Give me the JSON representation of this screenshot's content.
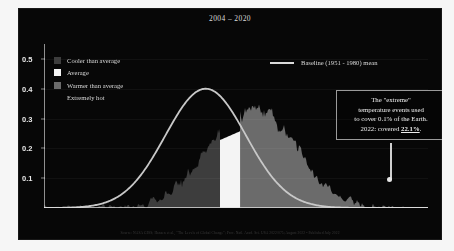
{
  "slide": {
    "title": "2004 – 2020",
    "background_color": "#070707",
    "text_color": "#dcdcdc"
  },
  "legend": {
    "items": [
      {
        "label": "Cooler than average",
        "swatch_color": "#3d3d3d",
        "name": "cooler-than-average"
      },
      {
        "label": "Average",
        "swatch_color": "#f4f4f4",
        "name": "average"
      },
      {
        "label": "Warmer than average",
        "swatch_color": "#6b6b6b",
        "name": "warmer-than-average"
      },
      {
        "label": "Extremely hot",
        "swatch_color": "transparent",
        "name": "extremely-hot"
      }
    ],
    "baseline": {
      "label": "Baseline (1951 - 1980) mean",
      "line_color": "#d9d9d9"
    }
  },
  "annotation": {
    "line1": "The \"extreme\"",
    "line2": "temperature events used",
    "line3": "to cover 0.1% of the Earth.",
    "line4_prefix": "2022: covered ",
    "line4_value": "22.1%",
    "line4_suffix": ".",
    "border_color": "#9a9a9a"
  },
  "axes": {
    "y_ticks": [
      "0.5",
      "0.4",
      "0.3",
      "0.2",
      "0.1"
    ],
    "y_values": [
      0.5,
      0.4,
      0.3,
      0.2,
      0.1
    ],
    "y_min": 0,
    "y_max": 0.55,
    "x_min": -4.0,
    "x_max": 5.5
  },
  "footer": {
    "source": "Source: NASA GISS; Hansen et al., \"The Levels of Global Change\"; Proc. Natl. Acad. Sci. USA 2022/075; August 2022 • Published July 2022"
  },
  "chart_data": {
    "type": "area",
    "title": "2004 – 2020",
    "xlabel": "",
    "ylabel": "",
    "ylim": [
      0,
      0.55
    ],
    "xlim": [
      -4.0,
      5.5
    ],
    "grid": false,
    "legend_position": "top-left",
    "series": [
      {
        "name": "Baseline (1951 - 1980) mean",
        "type": "line",
        "color": "#c8c8c8",
        "description": "Smooth normal distribution curve, mean 0, sigma 1, peak 0.40 at x=0",
        "mean": 0.0,
        "sigma": 1.0,
        "peak_value": 0.4,
        "x": [
          -4.0,
          -3.5,
          -3.0,
          -2.5,
          -2.0,
          -1.5,
          -1.0,
          -0.5,
          0.0,
          0.5,
          1.0,
          1.5,
          2.0
        ],
        "values": [
          0.0,
          0.001,
          0.004,
          0.018,
          0.054,
          0.13,
          0.242,
          0.352,
          0.399,
          0.352,
          0.242,
          0.13,
          0.054
        ]
      },
      {
        "name": "2004 - 2020 distribution (cooler than average)",
        "type": "area",
        "color": "#3d3d3d",
        "description": "Noisy histogram of temperature anomalies below the average band",
        "x_range": [
          -4.0,
          0.35
        ],
        "mean": 1.15,
        "sigma": 1.05,
        "peak_value": 0.33
      },
      {
        "name": "2004 - 2020 distribution (average)",
        "type": "area",
        "color": "#f4f4f4",
        "description": "White band marking the baseline average category",
        "x_range": [
          0.35,
          0.85
        ],
        "peak_value": 0.245
      },
      {
        "name": "2004 - 2020 distribution (warmer than average)",
        "type": "area",
        "color": "#6b6b6b",
        "description": "Noisy histogram of temperature anomalies above the average band, jagged peaks reaching 0.33",
        "x_range": [
          0.85,
          4.1
        ],
        "mean": 1.15,
        "sigma": 1.05,
        "peak_value": 0.335
      },
      {
        "name": "Extremely hot tail",
        "type": "area",
        "color": "#6b6b6b",
        "description": "Far right tail of the shifted distribution",
        "x_range": [
          4.1,
          5.2
        ],
        "peak_value": 0.02
      }
    ],
    "annotations": [
      {
        "text": "The \"extreme\" temperature events used to cover 0.1% of the Earth. 2022: covered 22.1%.",
        "points_to_x": 4.45,
        "points_to_y": 0.015
      }
    ]
  }
}
